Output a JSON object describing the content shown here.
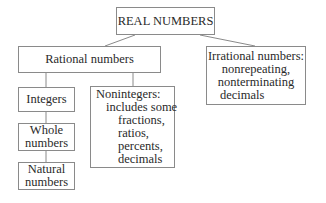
{
  "diagram": {
    "root": {
      "label": "REAL NUMBERS"
    },
    "rational": {
      "label": "Rational numbers"
    },
    "irrational": {
      "lines": [
        "Irrational numbers:",
        "nonrepeating,",
        "nonterminating",
        "decimals"
      ]
    },
    "integers": {
      "label": "Integers"
    },
    "whole": {
      "lines": [
        "Whole",
        "numbers"
      ]
    },
    "natural": {
      "lines": [
        "Natural",
        "numbers"
      ]
    },
    "nonintegers": {
      "lines": [
        "Nonintegers:",
        "includes some",
        "fractions,",
        "ratios,",
        "percents,",
        "decimals"
      ]
    },
    "line_color": "#8a8a8a"
  }
}
